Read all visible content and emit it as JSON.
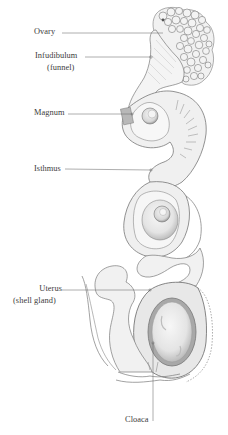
{
  "diagram": {
    "labels": [
      {
        "id": "ovary",
        "text": "Ovary",
        "sub": ""
      },
      {
        "id": "infundibulum",
        "text": "Infudibulum",
        "sub": "(funnel)"
      },
      {
        "id": "magnum",
        "text": "Magnum",
        "sub": ""
      },
      {
        "id": "isthmus",
        "text": "Isthmus",
        "sub": ""
      },
      {
        "id": "uterus",
        "text": "Uterus",
        "sub": "(shell gland)"
      },
      {
        "id": "cloaca",
        "text": "Cloaca",
        "sub": ""
      }
    ],
    "colors": {
      "line": "#6a6a6a",
      "outline": "#7a7a7a",
      "shade": "#cfcfcf",
      "light_fill": "#f2f2f2",
      "egg_fill": "#ececec",
      "text": "#3c3c3c"
    }
  }
}
